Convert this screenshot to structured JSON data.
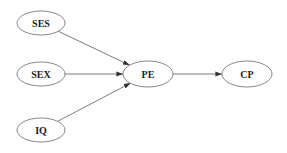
{
  "diagram": {
    "type": "path-diagram",
    "colors": {
      "background": "#ffffff",
      "node_stroke": "#7a7a7a",
      "edge_stroke": "#6e6e6e",
      "arrowhead": "#333333",
      "label": "#222222"
    },
    "nodes": [
      {
        "id": "SES",
        "label": "SES",
        "cx": 41,
        "cy": 23,
        "rx": 24,
        "ry": 12
      },
      {
        "id": "SEX",
        "label": "SEX",
        "cx": 41,
        "cy": 74,
        "rx": 24,
        "ry": 12
      },
      {
        "id": "IQ",
        "label": "IQ",
        "cx": 41,
        "cy": 130,
        "rx": 24,
        "ry": 12
      },
      {
        "id": "PE",
        "label": "PE",
        "cx": 148,
        "cy": 74,
        "rx": 25,
        "ry": 13
      },
      {
        "id": "CP",
        "label": "CP",
        "cx": 247,
        "cy": 74,
        "rx": 25,
        "ry": 13
      }
    ],
    "edges": [
      {
        "from": "SES",
        "to": "PE"
      },
      {
        "from": "SEX",
        "to": "PE"
      },
      {
        "from": "IQ",
        "to": "PE"
      },
      {
        "from": "PE",
        "to": "CP"
      }
    ]
  }
}
